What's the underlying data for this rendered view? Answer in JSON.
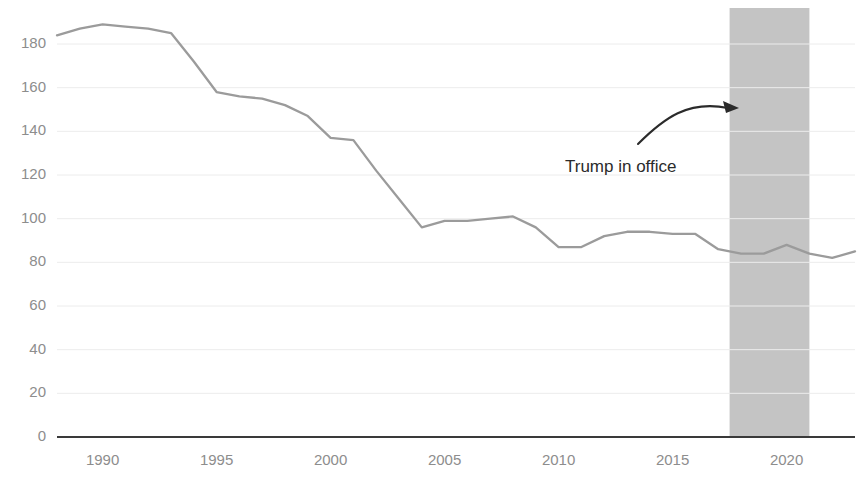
{
  "chart_data": {
    "type": "line",
    "title": "",
    "subtitle": "",
    "xlabel": "",
    "ylabel": "",
    "xlim": [
      1988,
      2023
    ],
    "ylim": [
      0,
      190
    ],
    "grid": true,
    "legend_position": "none",
    "x_ticks": [
      1990,
      1995,
      2000,
      2005,
      2010,
      2015,
      2020
    ],
    "x_tick_labels": [
      "1990",
      "1995",
      "2000",
      "2005",
      "2010",
      "2015",
      "2020"
    ],
    "y_ticks": [
      0,
      20,
      40,
      60,
      80,
      100,
      120,
      140,
      160,
      180
    ],
    "y_tick_labels": [
      "0",
      "20",
      "40",
      "60",
      "80",
      "100",
      "120",
      "140",
      "160",
      "180"
    ],
    "series": [
      {
        "name": "value",
        "color": "#9b9b9b",
        "x": [
          1988,
          1989,
          1990,
          1991,
          1992,
          1993,
          1994,
          1995,
          1996,
          1997,
          1998,
          1999,
          2000,
          2001,
          2002,
          2003,
          2004,
          2005,
          2006,
          2007,
          2008,
          2009,
          2010,
          2011,
          2012,
          2013,
          2014,
          2015,
          2016,
          2017,
          2018,
          2019,
          2020,
          2021,
          2022,
          2023
        ],
        "values": [
          184,
          187,
          189,
          188,
          187,
          185,
          172,
          158,
          156,
          155,
          152,
          147,
          137,
          136,
          122,
          109,
          96,
          99,
          99,
          100,
          101,
          96,
          87,
          87,
          92,
          94,
          94,
          93,
          93,
          86,
          84,
          84,
          88,
          84,
          82,
          85
        ]
      }
    ],
    "shaded_regions": [
      {
        "name": "trump-in-office",
        "x_start": 2017.5,
        "x_end": 2021.0,
        "color": "#c4c4c4"
      }
    ],
    "annotations": [
      {
        "name": "trump-in-office",
        "text": "Trump in office",
        "text_x": 565,
        "text_y": 172,
        "arrow_start_x": 638,
        "arrow_start_y": 144,
        "arrow_end_x": 734,
        "arrow_end_y": 108,
        "color": "#2b2b2b"
      }
    ],
    "axis_line_color": "#3a3a3a",
    "grid_color": "#ececec",
    "tick_label_color": "#8d8d8d"
  }
}
